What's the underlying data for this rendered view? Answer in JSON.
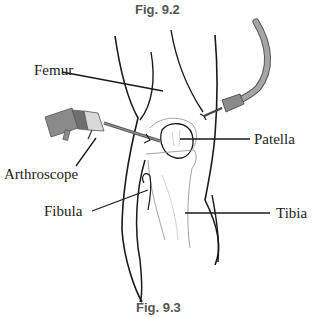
{
  "figure": {
    "caption_top": "Fig. 9.2",
    "caption_bottom": "Fig. 9.3"
  },
  "labels": {
    "femur": "Femur",
    "patella": "Patella",
    "arthroscope": "Arthroscope",
    "fibula": "Fibula",
    "tibia": "Tibia"
  },
  "colors": {
    "outline": "#1a1a1a",
    "instrument_gray": "#8a8a8a",
    "instrument_light": "#d9d9d9",
    "tube_gray": "#9b9b9b",
    "caption": "#555555",
    "label": "#222222"
  }
}
